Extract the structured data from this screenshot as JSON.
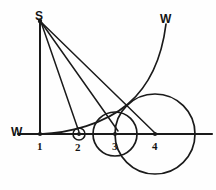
{
  "figure": {
    "ink_color": "#1a1a1a",
    "background_color": "#fefefe",
    "labels": {
      "apex": "S",
      "baseline_left": "W",
      "curve_top": "W",
      "point_1": "1",
      "point_2": "2",
      "point_3": "3",
      "point_4": "4"
    },
    "points": [
      {
        "name": "S",
        "label": "S",
        "x": 40,
        "y": 20
      },
      {
        "name": "P1",
        "label": "1",
        "x": 40,
        "y": 134
      },
      {
        "name": "P2",
        "label": "2",
        "x": 79,
        "y": 134
      },
      {
        "name": "P3",
        "label": "3",
        "x": 115,
        "y": 134
      },
      {
        "name": "P4",
        "label": "4",
        "x": 155,
        "y": 134
      }
    ],
    "baseline": {
      "x1": 18,
      "y1": 134,
      "x2": 212,
      "y2": 134
    },
    "vertical": {
      "x1": 40,
      "y1": 21,
      "x2": 40,
      "y2": 134
    },
    "rays": [
      {
        "name": "ray-S-to-2",
        "x1": 41,
        "y1": 22,
        "x2": 79,
        "y2": 132
      },
      {
        "name": "ray-S-to-3",
        "x1": 41,
        "y1": 22,
        "x2": 118,
        "y2": 131
      },
      {
        "name": "ray-S-to-4",
        "x1": 41,
        "y1": 22,
        "x2": 155,
        "y2": 133
      }
    ],
    "circles": [
      {
        "name": "circle-at-2",
        "cx": 79,
        "cy": 134,
        "r": 6
      },
      {
        "name": "circle-at-3",
        "cx": 115,
        "cy": 134,
        "r": 22
      },
      {
        "name": "circle-at-4",
        "cx": 155,
        "cy": 134,
        "r": 40
      }
    ],
    "curve": {
      "name": "rising-curve-W",
      "description": "Curve tangent to the baseline near point 1, rising steeply to the upper right",
      "path": "M 40 134 C 70 133, 104 124, 128 104 C 150 85, 162 56, 166 24"
    }
  }
}
